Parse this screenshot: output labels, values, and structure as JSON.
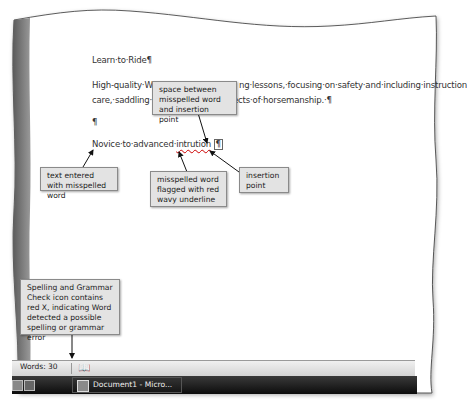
{
  "document": {
    "title_line": "Learn·to·Ride¶",
    "para_line1": "High-quality·W",
    "para_line1_rest": "ng·lessons,·focusing·on·safety·and·including·instruction",
    "para_line2": "care,·saddling·a",
    "para_line2_rest": "ects·of·horsemanship.·¶",
    "empty_para": "¶",
    "typed_prefix": "Novice·to·advanced·",
    "misspelled_word": "intrution",
    "pilcrow": "¶"
  },
  "callouts": {
    "space_between": "space between misspelled word and insertion point",
    "text_entered": "text entered with misspelled word",
    "misspelled_flagged": "misspelled word flagged with red wavy underline",
    "insertion_point": "insertion point",
    "spelling_icon": "Spelling and Grammar Check icon contains red X, indicating Word detected a possible spelling or grammar error"
  },
  "status_bar": {
    "words_label": "Words: 30",
    "spelling_icon": "spelling-grammar-check-icon"
  },
  "taskbar": {
    "task_label": "Document1 - Micro..."
  },
  "colors": {
    "misspelling_underline": "#c00000",
    "callout_bg": "#e3e3e3"
  }
}
